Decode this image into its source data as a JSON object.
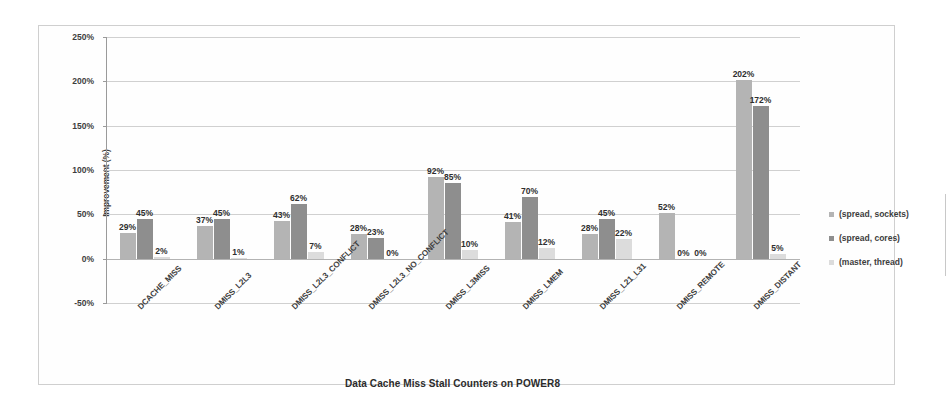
{
  "chart_data": {
    "type": "bar",
    "title": "Data Cache Miss Stall Counters on POWER8",
    "xlabel": "Data Cache Miss Stall Counters on POWER8",
    "ylabel": "Improvement (%)",
    "ylim": [
      -50,
      250
    ],
    "ytick_labels": [
      "250%",
      "200%",
      "150%",
      "100%",
      "50%",
      "0%",
      "-50%"
    ],
    "ytick_values": [
      250,
      200,
      150,
      100,
      50,
      0,
      -50
    ],
    "grid": true,
    "legend_position": "right",
    "categories": [
      "DCACHE_MISS",
      "DMISS_L2L3",
      "DMISS_L2L3_CONFLICT",
      "DMISS_L2L3_NO_CONFLICT",
      "DMISS_L3MISS",
      "DMISS_LMEM",
      "DMISS_L21_L31",
      "DMISS_REMOTE",
      "DMISS_DISTANT"
    ],
    "series": [
      {
        "name": "(spread, sockets)",
        "color": "#b4b4b4",
        "values": [
          29,
          37,
          43,
          28,
          92,
          41,
          28,
          52,
          202
        ],
        "labels": [
          "29%",
          "37%",
          "43%",
          "28%",
          "92%",
          "41%",
          "28%",
          "52%",
          "202%"
        ]
      },
      {
        "name": "(spread, cores)",
        "color": "#8e8e8e",
        "values": [
          45,
          45,
          62,
          23,
          85,
          70,
          45,
          0,
          172
        ],
        "labels": [
          "45%",
          "45%",
          "62%",
          "23%",
          "85%",
          "70%",
          "45%",
          "0%",
          "172%"
        ]
      },
      {
        "name": "(master, thread)",
        "color": "#dcdcdc",
        "values": [
          2,
          1,
          7,
          0,
          10,
          12,
          22,
          0,
          5
        ],
        "labels": [
          "2%",
          "1%",
          "7%",
          "0%",
          "10%",
          "12%",
          "22%",
          "0%",
          "5%"
        ]
      }
    ]
  },
  "legend": {
    "items": [
      {
        "label": "(spread, sockets)",
        "color": "#b4b4b4"
      },
      {
        "label": "(spread, cores)",
        "color": "#8e8e8e"
      },
      {
        "label": "(master, thread)",
        "color": "#dcdcdc"
      }
    ]
  }
}
